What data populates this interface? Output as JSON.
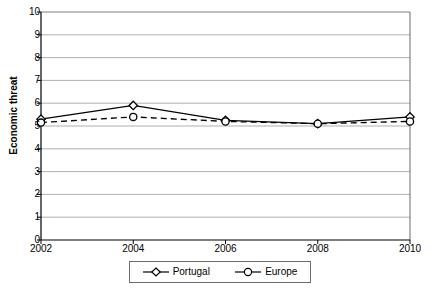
{
  "chart_data": {
    "type": "line",
    "title": "",
    "xlabel": "",
    "ylabel": "Economic threat",
    "categories": [
      "2002",
      "2004",
      "2006",
      "2008",
      "2010"
    ],
    "x": [
      2002,
      2004,
      2006,
      2008,
      2010
    ],
    "xlim": [
      2002,
      2010
    ],
    "ylim": [
      0,
      10
    ],
    "ytick_labels": [
      "0",
      "1",
      "2",
      "3",
      "4",
      "5",
      "6",
      "7",
      "8",
      "9",
      "10"
    ],
    "ytick_values": [
      0,
      1,
      2,
      3,
      4,
      5,
      6,
      7,
      8,
      9,
      10
    ],
    "grid": "horizontal",
    "legend_position": "bottom",
    "series": [
      {
        "name": "Portugal",
        "values": [
          5.3,
          5.9,
          5.25,
          5.1,
          5.4
        ],
        "marker": "diamond",
        "line_style": "solid",
        "color": "#000000"
      },
      {
        "name": "Europe",
        "values": [
          5.15,
          5.4,
          5.2,
          5.1,
          5.2
        ],
        "marker": "circle",
        "line_style": "dashed",
        "color": "#000000"
      }
    ]
  },
  "axis": {
    "y_title": "Economic threat"
  },
  "legend": {
    "entries": [
      {
        "label": "Portugal"
      },
      {
        "label": "Europe"
      }
    ]
  },
  "colors": {
    "axis": "#000000",
    "grid": "#9a9a9a",
    "frame": "#6b6b6b",
    "series": "#000000",
    "background": "#ffffff"
  }
}
